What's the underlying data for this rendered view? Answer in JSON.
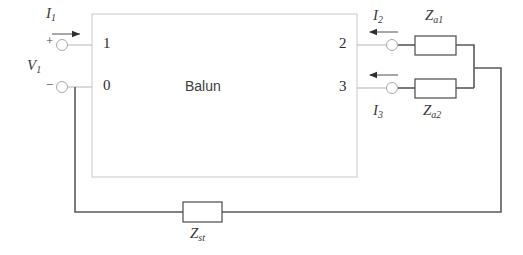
{
  "diagram": {
    "block": {
      "name": "Balun",
      "ports": {
        "left_top": "1",
        "left_bottom": "0",
        "right_top": "2",
        "right_bottom": "3"
      }
    },
    "source": {
      "voltage_label": "V",
      "voltage_sub": "1",
      "plus_sign": "+",
      "minus_sign": "−"
    },
    "currents": [
      {
        "label": "I",
        "sub": "1",
        "direction": "right"
      },
      {
        "label": "I",
        "sub": "2",
        "direction": "left"
      },
      {
        "label": "I",
        "sub": "3",
        "direction": "left"
      }
    ],
    "impedances": [
      {
        "label": "Z",
        "sub": "a1",
        "position": "top-right"
      },
      {
        "label": "Z",
        "sub": "a2",
        "position": "bottom-right"
      },
      {
        "label": "Z",
        "sub": "st",
        "position": "bottom-center"
      }
    ],
    "colors": {
      "wire": "#5a5a5a",
      "block_border": "#c9c9c9",
      "component_border": "#4a4a4a",
      "text": "#3a3a3a",
      "background": "#ffffff"
    }
  }
}
